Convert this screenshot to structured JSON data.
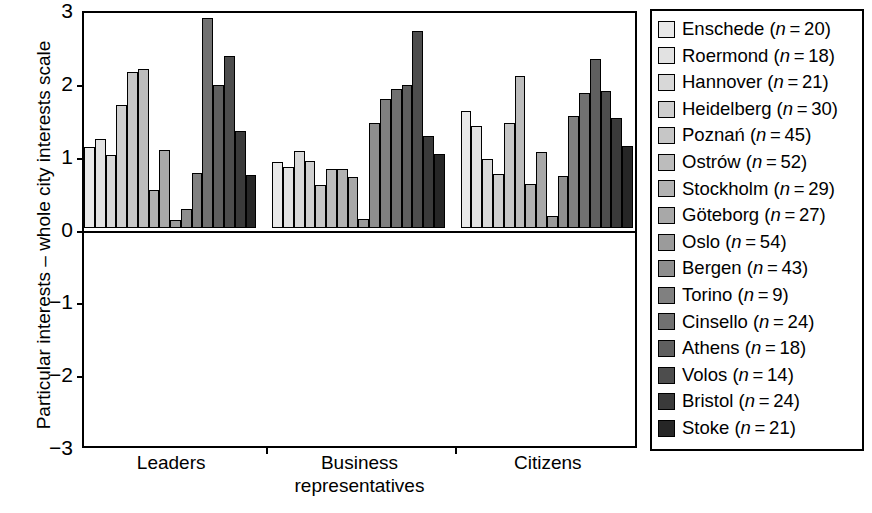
{
  "chart_data": {
    "type": "bar",
    "title": "",
    "xlabel": "",
    "ylabel": "Particular interests – whole city interests scale",
    "ylim": [
      -3,
      3
    ],
    "yticks": [
      3,
      2,
      1,
      0,
      -1,
      -2,
      -3
    ],
    "ytick_labels": [
      "3",
      "2",
      "1",
      "0",
      "−1",
      "−2",
      "−3"
    ],
    "grid": false,
    "legend_position": "right",
    "categories": [
      "Leaders",
      "Business representatives",
      "Citizens"
    ],
    "category_lines": [
      [
        "Leaders"
      ],
      [
        "Business",
        "representatives"
      ],
      [
        "Citizens"
      ]
    ],
    "series": [
      {
        "name": "Enschede",
        "n": 20,
        "label": "Enschede (n = 20)",
        "color": "#e9e9e9",
        "values": [
          1.1,
          0.9,
          1.6
        ]
      },
      {
        "name": "Roermond",
        "n": 18,
        "label": "Roermond (n = 18)",
        "color": "#e2e2e2",
        "values": [
          1.21,
          0.83,
          1.4
        ]
      },
      {
        "name": "Hannover",
        "n": 21,
        "label": "Hannover (n = 21)",
        "color": "#d8d8d8",
        "values": [
          1.0,
          1.05,
          0.94
        ]
      },
      {
        "name": "Heidelberg",
        "n": 30,
        "label": "Heidelberg (n = 30)",
        "color": "#cfcfcf",
        "values": [
          1.68,
          0.92,
          0.74
        ]
      },
      {
        "name": "Poznań",
        "n": 45,
        "label": "Poznań (n = 45)",
        "color": "#c6c6c6",
        "values": [
          2.14,
          0.59,
          1.43
        ]
      },
      {
        "name": "Ostrów",
        "n": 52,
        "label": "Ostrów (n = 52)",
        "color": "#bcbcbc",
        "values": [
          2.18,
          0.81,
          2.08
        ]
      },
      {
        "name": "Stockholm",
        "n": 29,
        "label": "Stockholm (n = 29)",
        "color": "#b2b2b2",
        "values": [
          0.52,
          0.81,
          0.6
        ]
      },
      {
        "name": "Göteborg",
        "n": 27,
        "label": "Göteborg (n = 27)",
        "color": "#a8a8a8",
        "values": [
          1.06,
          0.69,
          1.03
        ]
      },
      {
        "name": "Oslo",
        "n": 54,
        "label": "Oslo (n = 54)",
        "color": "#9b9b9b",
        "values": [
          0.1,
          0.12,
          0.16
        ]
      },
      {
        "name": "Bergen",
        "n": 43,
        "label": "Bergen (n = 43)",
        "color": "#8e8e8e",
        "values": [
          0.25,
          1.43,
          0.71
        ]
      },
      {
        "name": "Torino",
        "n": 9,
        "label": "Torino (n = 9)",
        "color": "#808080",
        "values": [
          0.75,
          1.77,
          1.53
        ]
      },
      {
        "name": "Cinsello",
        "n": 24,
        "label": "Cinsello (n = 24)",
        "color": "#717171",
        "values": [
          2.87,
          1.9,
          1.85
        ]
      },
      {
        "name": "Athens",
        "n": 18,
        "label": "Athens (n = 18)",
        "color": "#5f5f5f",
        "values": [
          1.95,
          1.95,
          2.31
        ]
      },
      {
        "name": "Volos",
        "n": 14,
        "label": "Volos (n = 14)",
        "color": "#4d4d4d",
        "values": [
          2.36,
          2.7,
          1.88
        ]
      },
      {
        "name": "Bristol",
        "n": 24,
        "label": "Bristol (n = 24)",
        "color": "#3a3a3a",
        "values": [
          1.32,
          1.25,
          1.51
        ]
      },
      {
        "name": "Stoke",
        "n": 21,
        "label": "Stoke (n = 21)",
        "color": "#262626",
        "values": [
          0.72,
          1.01,
          1.12
        ]
      }
    ]
  },
  "axis": {
    "y_title": "Particular interests – whole city interests scale"
  }
}
